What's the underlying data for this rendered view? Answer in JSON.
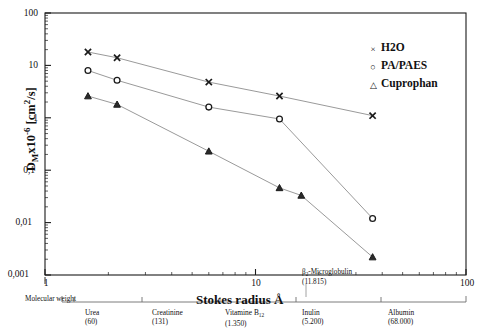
{
  "chart_data": {
    "type": "line",
    "title": "",
    "xlabel": "Stokes radius Å",
    "ylabel": "Dₘx10⁻⁶ [cm²/s]",
    "xscale": "log",
    "yscale": "log",
    "xlim": [
      1,
      100
    ],
    "ylim": [
      0.001,
      100
    ],
    "grid": false,
    "legend_position": "top-right",
    "x_tick_labels": [
      "1",
      "10",
      "100"
    ],
    "y_tick_labels": [
      "100",
      "10",
      "1",
      "0,1",
      "0,01",
      "0,001"
    ],
    "series": [
      {
        "name": "H2O",
        "marker": "x",
        "x": [
          1.6,
          2.2,
          6.0,
          13.0,
          36.0
        ],
        "y": [
          18.0,
          14.0,
          4.8,
          2.6,
          1.1
        ]
      },
      {
        "name": "PA/PAES",
        "marker": "circle",
        "x": [
          1.6,
          2.2,
          6.0,
          13.0,
          36.0
        ],
        "y": [
          8.0,
          5.2,
          1.6,
          0.95,
          0.012
        ]
      },
      {
        "name": "Cuprophan",
        "marker": "triangle",
        "x": [
          1.6,
          2.2,
          6.0,
          13.0,
          16.5,
          36.0
        ],
        "y": [
          2.6,
          1.8,
          0.23,
          0.046,
          0.033,
          0.0022
        ]
      }
    ]
  },
  "legend": {
    "items": [
      {
        "symbol": "×",
        "label": "H2O"
      },
      {
        "symbol": "○",
        "label": "PA/PAES"
      },
      {
        "symbol": "△",
        "label": "Cuprophan"
      }
    ]
  },
  "secondary_axis": {
    "caption": "Molecular weight",
    "solutes": [
      {
        "name": "Urea",
        "weight": "(60)"
      },
      {
        "name": "Creatinine",
        "weight": "(131)"
      },
      {
        "name": "Vitamine B",
        "sub": "12",
        "weight": "(1.350)"
      },
      {
        "name": "Inulin",
        "weight": "(5.200)"
      },
      {
        "name": "Albumin",
        "weight": "(68.000)"
      }
    ],
    "inline_solute": {
      "name": "β",
      "sub": "2",
      "rest": "-Microglobulin",
      "weight": "(11.815)"
    }
  },
  "axes": {
    "y_title_main": "D",
    "y_title_sub": "M",
    "y_title_rest": "x10",
    "y_title_exp": "-6",
    "y_title_units_a": " [cm",
    "y_title_units_exp": "2",
    "y_title_units_b": "/s]",
    "x_title": "Stokes radius Å"
  },
  "colors": {
    "axis": "#1b1b1b",
    "line": "#9a9a9a",
    "marker": "#1b1b1b",
    "background": "#ffffff"
  }
}
